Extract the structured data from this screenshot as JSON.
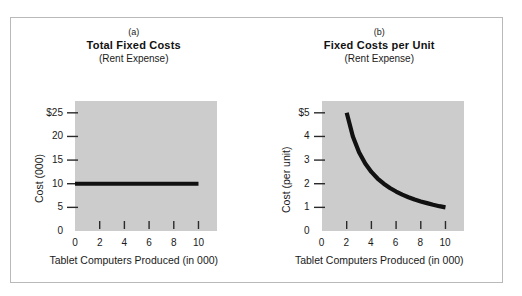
{
  "figure": {
    "background_color": "#ffffff",
    "border_color": "#b9b9b9",
    "plot_fill_color": "#cccccc",
    "data_color": "#111111"
  },
  "panels": [
    {
      "index": "(a)",
      "title": "Total Fixed Costs",
      "subtitle": "(Rent Expense)",
      "ylabel": "Cost (000)",
      "xlabel": "Tablet Computers Produced (in 000)",
      "yticks": [
        "0",
        "5",
        "10",
        "15",
        "20",
        "$25"
      ],
      "xticks": [
        "0",
        "2",
        "4",
        "6",
        "8",
        "10"
      ]
    },
    {
      "index": "(b)",
      "title": "Fixed Costs per Unit",
      "subtitle": "(Rent Expense)",
      "ylabel": "Cost (per unit)",
      "xlabel": "Tablet Computers Produced (in 000)",
      "yticks": [
        "0",
        "1",
        "2",
        "3",
        "4",
        "$5"
      ],
      "xticks": [
        "0",
        "2",
        "4",
        "6",
        "8",
        "10"
      ]
    }
  ],
  "chart_data": [
    {
      "type": "line",
      "title": "Total Fixed Costs",
      "subtitle": "(Rent Expense)",
      "panel": "(a)",
      "xlabel": "Tablet Computers Produced (in 000)",
      "ylabel": "Cost (000)",
      "xlim": [
        0,
        11.5
      ],
      "ylim": [
        0,
        27.5
      ],
      "xticks": [
        0,
        2,
        4,
        6,
        8,
        10
      ],
      "xticklabels": [
        "0",
        "2",
        "4",
        "6",
        "8",
        "10"
      ],
      "yticks": [
        0,
        5,
        10,
        15,
        20,
        25
      ],
      "yticklabels": [
        "0",
        "5",
        "10",
        "15",
        "20",
        "$25"
      ],
      "grid": false,
      "legend": false,
      "series": [
        {
          "name": "Total fixed cost",
          "x": [
            0,
            1,
            2,
            3,
            4,
            5,
            6,
            7,
            8,
            9,
            10
          ],
          "values": [
            10,
            10,
            10,
            10,
            10,
            10,
            10,
            10,
            10,
            10,
            10
          ]
        }
      ]
    },
    {
      "type": "line",
      "title": "Fixed Costs per Unit",
      "subtitle": "(Rent Expense)",
      "panel": "(b)",
      "xlabel": "Tablet Computers Produced (in 000)",
      "ylabel": "Cost (per unit)",
      "xlim": [
        0,
        11.5
      ],
      "ylim": [
        0,
        5.5
      ],
      "xticks": [
        0,
        2,
        4,
        6,
        8,
        10
      ],
      "xticklabels": [
        "0",
        "2",
        "4",
        "6",
        "8",
        "10"
      ],
      "yticks": [
        0,
        1,
        2,
        3,
        4,
        5
      ],
      "yticklabels": [
        "0",
        "1",
        "2",
        "3",
        "4",
        "$5"
      ],
      "grid": false,
      "legend": false,
      "series": [
        {
          "name": "Fixed cost per unit",
          "x": [
            2,
            2.5,
            3,
            3.5,
            4,
            4.5,
            5,
            5.5,
            6,
            6.5,
            7,
            7.5,
            8,
            8.5,
            9,
            9.5,
            10
          ],
          "values": [
            5,
            4,
            3.33,
            2.86,
            2.5,
            2.22,
            2,
            1.82,
            1.67,
            1.54,
            1.43,
            1.33,
            1.25,
            1.18,
            1.11,
            1.05,
            1
          ]
        }
      ]
    }
  ]
}
